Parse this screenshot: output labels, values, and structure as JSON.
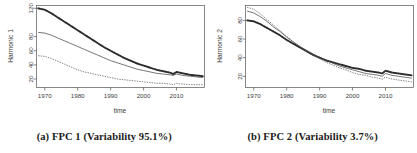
{
  "figure": {
    "background": "#ffffff",
    "panel_count": 2
  },
  "panels": [
    {
      "id": "panel-a",
      "caption": "(a) FPC 1 (Variability 95.1%)",
      "ylabel": "Harmonic 1",
      "xlabel": "time",
      "yticks": [
        "20",
        "40",
        "60",
        "80",
        "120"
      ],
      "ytick_values": [
        20,
        40,
        60,
        80,
        120
      ],
      "xticks": [
        "1970",
        "1980",
        "1990",
        "2000",
        "2010"
      ],
      "xtick_values": [
        1970,
        1980,
        1990,
        2000,
        2010
      ]
    },
    {
      "id": "panel-b",
      "caption": "(b) FPC 2 (Variability 3.7%)",
      "ylabel": "Harmonic 2",
      "xlabel": "time",
      "yticks": [
        "20",
        "40",
        "60",
        "80"
      ],
      "ytick_values": [
        20,
        40,
        60,
        80
      ],
      "xticks": [
        "1970",
        "1980",
        "1990",
        "2000",
        "2010"
      ],
      "xtick_values": [
        1970,
        1980,
        1990,
        2000,
        2010
      ]
    }
  ],
  "chart_data": [
    {
      "type": "line",
      "id": "fpc-1",
      "title": "(a) FPC 1 (Variability 95.1%)",
      "xlabel": "time",
      "ylabel": "Harmonic 1",
      "xlim": [
        1967.5,
        2018.5
      ],
      "ylim": [
        8,
        124
      ],
      "xticks": [
        1970,
        1980,
        1990,
        2000,
        2010
      ],
      "yticks": [
        20,
        40,
        60,
        80,
        120
      ],
      "grid": false,
      "legend": "none",
      "x": [
        1968,
        1970,
        1972,
        1974,
        1976,
        1978,
        1980,
        1982,
        1984,
        1986,
        1988,
        1990,
        1992,
        1994,
        1996,
        1998,
        2000,
        2002,
        2004,
        2006,
        2008,
        2009,
        2010,
        2011,
        2012,
        2014,
        2016,
        2018
      ],
      "series": [
        {
          "name": "mean + harmonic (dotted, markers)",
          "style": "dotted-thick",
          "values": [
            120,
            118,
            113,
            107,
            101,
            95,
            89,
            83,
            77,
            71,
            65,
            60,
            55,
            50,
            46,
            42,
            39,
            36,
            33,
            31,
            29,
            27,
            30,
            29,
            28,
            26,
            25,
            24
          ]
        },
        {
          "name": "mean (solid)",
          "style": "solid-thin",
          "values": [
            86,
            85,
            82,
            78,
            74,
            70,
            66,
            62,
            58,
            54,
            50,
            46,
            43,
            40,
            37,
            34,
            32,
            30,
            28,
            27,
            26,
            25,
            27,
            26,
            25,
            24,
            23,
            22
          ]
        },
        {
          "name": "mean - harmonic (dashed)",
          "style": "dashed-thin",
          "values": [
            53,
            52,
            49,
            45,
            41,
            37,
            33,
            30,
            28,
            26,
            24,
            22,
            20,
            19,
            18,
            17,
            16,
            15,
            14,
            14,
            13,
            12,
            14,
            13,
            13,
            12,
            12,
            12
          ]
        }
      ]
    },
    {
      "type": "line",
      "id": "fpc-2",
      "title": "(b) FPC 2 (Variability 3.7%)",
      "xlabel": "time",
      "ylabel": "Harmonic 2",
      "xlim": [
        1967.5,
        2018.5
      ],
      "ylim": [
        8,
        96
      ],
      "xticks": [
        1970,
        1980,
        1990,
        2000,
        2010
      ],
      "yticks": [
        20,
        40,
        60,
        80
      ],
      "grid": false,
      "legend": "none",
      "x": [
        1968,
        1970,
        1972,
        1974,
        1976,
        1978,
        1980,
        1982,
        1984,
        1986,
        1988,
        1990,
        1992,
        1994,
        1996,
        1998,
        2000,
        2002,
        2004,
        2006,
        2008,
        2009,
        2010,
        2011,
        2012,
        2014,
        2016,
        2018
      ],
      "series": [
        {
          "name": "mean + harmonic (dotted, markers)",
          "style": "dotted-thick",
          "values": [
            80,
            79,
            76,
            72,
            68,
            64,
            59,
            55,
            51,
            47,
            43,
            40,
            37,
            35,
            33,
            31,
            29,
            28,
            26,
            25,
            24,
            23,
            26,
            25,
            24,
            23,
            22,
            21
          ]
        },
        {
          "name": "mean (solid)",
          "style": "solid-thin",
          "values": [
            90,
            88,
            84,
            79,
            73,
            68,
            62,
            57,
            52,
            48,
            44,
            40,
            37,
            34,
            31,
            29,
            27,
            25,
            23,
            22,
            21,
            20,
            23,
            22,
            21,
            20,
            19,
            18
          ]
        },
        {
          "name": "mean - harmonic (dashed)",
          "style": "dashed-thin",
          "values": [
            94,
            92,
            87,
            81,
            75,
            69,
            63,
            57,
            52,
            47,
            43,
            39,
            35,
            32,
            29,
            27,
            24,
            22,
            21,
            19,
            18,
            17,
            19,
            18,
            17,
            16,
            15,
            14
          ]
        }
      ]
    }
  ]
}
